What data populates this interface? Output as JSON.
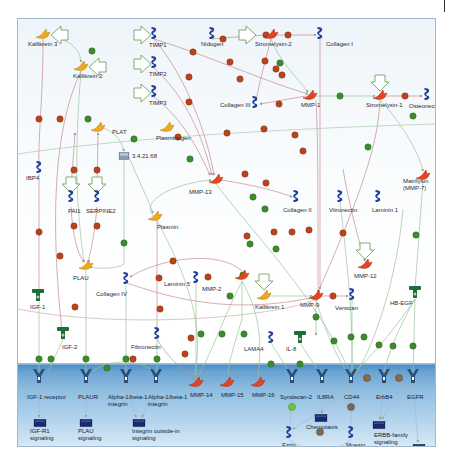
{
  "diagram": {
    "nodes": [
      {
        "id": "kallikrein3",
        "label": "Kallikrein 3",
        "type": "protease-yellow",
        "x": 25,
        "y": 16,
        "lx": 10,
        "ly": 22
      },
      {
        "id": "kallikrein2",
        "label": "Kallikrein 2",
        "type": "protease-yellow",
        "x": 63,
        "y": 48,
        "lx": 55,
        "ly": 54
      },
      {
        "id": "timp1",
        "label": "TIMP1",
        "type": "inhibitor-blue",
        "x": 136,
        "y": 16,
        "lx": 131,
        "ly": 23
      },
      {
        "id": "timp2",
        "label": "TIMP2",
        "type": "inhibitor-blue",
        "x": 136,
        "y": 45,
        "lx": 131,
        "ly": 52
      },
      {
        "id": "timp3",
        "label": "TIMP3",
        "type": "inhibitor-blue",
        "x": 136,
        "y": 74,
        "lx": 131,
        "ly": 81
      },
      {
        "id": "nidogen",
        "label": "Nidogen",
        "type": "inhibitor-blue",
        "x": 194,
        "y": 16,
        "lx": 183,
        "ly": 22
      },
      {
        "id": "stromelysin2",
        "label": "Stromelysin-2",
        "type": "protease-red",
        "x": 253,
        "y": 16,
        "lx": 237,
        "ly": 22
      },
      {
        "id": "collagen1",
        "label": "Collagen I",
        "type": "inhibitor-blue",
        "x": 302,
        "y": 16,
        "lx": 308,
        "ly": 22
      },
      {
        "id": "collagen3",
        "label": "Collagen III",
        "type": "inhibitor-blue",
        "x": 237,
        "y": 85,
        "lx": 202,
        "ly": 83
      },
      {
        "id": "mmp1",
        "label": "MMP-1",
        "type": "protease-red",
        "x": 292,
        "y": 77,
        "lx": 283,
        "ly": 83
      },
      {
        "id": "stromelysin1",
        "label": "Stromelysin-1",
        "type": "protease-red",
        "x": 362,
        "y": 77,
        "lx": 348,
        "ly": 83
      },
      {
        "id": "osteonectin",
        "label": "Osteonectin",
        "type": "inhibitor-blue",
        "x": 409,
        "y": 77,
        "lx": 391,
        "ly": 84
      },
      {
        "id": "plat",
        "label": "PLAT",
        "type": "protease-yellow",
        "x": 80,
        "y": 109,
        "lx": 94,
        "ly": 110
      },
      {
        "id": "plasminogen",
        "label": "Plasminogen",
        "type": "protease-yellow",
        "x": 149,
        "y": 109,
        "lx": 138,
        "ly": 116
      },
      {
        "id": "ec3421",
        "label": "3.4.21.68",
        "type": "compound-grey",
        "x": 106,
        "y": 136,
        "lx": 114,
        "ly": 134
      },
      {
        "id": "ibp4",
        "label": "IBP4",
        "type": "inhibitor-blue",
        "x": 21,
        "y": 150,
        "lx": 8,
        "ly": 156
      },
      {
        "id": "pai1",
        "label": "PAI1",
        "type": "inhibitor-blue",
        "x": 53,
        "y": 179,
        "lx": 50,
        "ly": 189
      },
      {
        "id": "serpine2",
        "label": "SERPINE2",
        "type": "inhibitor-blue",
        "x": 79,
        "y": 179,
        "lx": 68,
        "ly": 189
      },
      {
        "id": "mmp13",
        "label": "MMP-13",
        "type": "protease-red",
        "x": 198,
        "y": 161,
        "lx": 171,
        "ly": 170
      },
      {
        "id": "plasmin",
        "label": "Plasmin",
        "type": "protease-yellow",
        "x": 137,
        "y": 198,
        "lx": 139,
        "ly": 205
      },
      {
        "id": "collagen2",
        "label": "Collagen II",
        "type": "inhibitor-blue",
        "x": 278,
        "y": 179,
        "lx": 265,
        "ly": 188
      },
      {
        "id": "vitronectin",
        "label": "Vitronectin",
        "type": "inhibitor-blue",
        "x": 322,
        "y": 179,
        "lx": 311,
        "ly": 188
      },
      {
        "id": "laminin1",
        "label": "Laminin 1",
        "type": "inhibitor-blue",
        "x": 360,
        "y": 179,
        "lx": 354,
        "ly": 188
      },
      {
        "id": "matrilysin",
        "label": "Matrilysin\n(MMP-7)",
        "type": "protease-red",
        "x": 405,
        "y": 157,
        "lx": 385,
        "ly": 159
      },
      {
        "id": "plau",
        "label": "PLAU",
        "type": "protease-yellow",
        "x": 68,
        "y": 247,
        "lx": 55,
        "ly": 256
      },
      {
        "id": "igf1",
        "label": "IGF-1",
        "type": "ligand-green",
        "x": 20,
        "y": 278,
        "lx": 12,
        "ly": 285
      },
      {
        "id": "collagen4",
        "label": "Collagen IV",
        "type": "inhibitor-blue",
        "x": 108,
        "y": 261,
        "lx": 78,
        "ly": 272
      },
      {
        "id": "laminin5",
        "label": "Laminin 5",
        "type": "inhibitor-blue",
        "x": 178,
        "y": 260,
        "lx": 146,
        "ly": 262
      },
      {
        "id": "mmp2",
        "label": "MMP-2",
        "type": "protease-red",
        "x": 224,
        "y": 257,
        "lx": 184,
        "ly": 267
      },
      {
        "id": "mmp12",
        "label": "MMP-12",
        "type": "protease-red",
        "x": 347,
        "y": 246,
        "lx": 336,
        "ly": 254
      },
      {
        "id": "kallikrein1",
        "label": "Kallikrein 1",
        "type": "protease-yellow",
        "x": 246,
        "y": 277,
        "lx": 237,
        "ly": 285
      },
      {
        "id": "mmp9",
        "label": "MMP-9",
        "type": "protease-red",
        "x": 298,
        "y": 277,
        "lx": 282,
        "ly": 283
      },
      {
        "id": "versican",
        "label": "Versican",
        "type": "inhibitor-blue",
        "x": 334,
        "y": 277,
        "lx": 317,
        "ly": 286
      },
      {
        "id": "hbegf",
        "label": "HB-EGF",
        "type": "ligand-green",
        "x": 397,
        "y": 275,
        "lx": 372,
        "ly": 281
      },
      {
        "id": "igf2",
        "label": "IGF-2",
        "type": "ligand-green",
        "x": 45,
        "y": 316,
        "lx": 44,
        "ly": 325
      },
      {
        "id": "fibronectin",
        "label": "Fibronectin",
        "type": "inhibitor-blue",
        "x": 139,
        "y": 316,
        "lx": 113,
        "ly": 325
      },
      {
        "id": "lama4",
        "label": "LAMA4",
        "type": "inhibitor-blue",
        "x": 253,
        "y": 320,
        "lx": 226,
        "ly": 327
      },
      {
        "id": "il8",
        "label": "IL-8",
        "type": "ligand-green",
        "x": 282,
        "y": 320,
        "lx": 268,
        "ly": 327
      },
      {
        "id": "igf1r",
        "label": "IGF-1 receptor",
        "type": "receptor",
        "x": 21,
        "y": 359,
        "lx": 9,
        "ly": 375
      },
      {
        "id": "plaur",
        "label": "PLAUR",
        "type": "receptor",
        "x": 68,
        "y": 359,
        "lx": 60,
        "ly": 375
      },
      {
        "id": "a1b1a",
        "label": "Alpha-1/beta-1\nintegrin",
        "type": "receptor",
        "x": 108,
        "y": 359,
        "lx": 90,
        "ly": 375
      },
      {
        "id": "a1b1b",
        "label": "Alpha-1/beta-1\nintegrin",
        "type": "receptor",
        "x": 138,
        "y": 359,
        "lx": 130,
        "ly": 375
      },
      {
        "id": "mmp14",
        "label": "MMP-14",
        "type": "protease-red",
        "x": 178,
        "y": 364,
        "lx": 172,
        "ly": 373
      },
      {
        "id": "mmp15",
        "label": "MMP-15",
        "type": "protease-red",
        "x": 209,
        "y": 364,
        "lx": 203,
        "ly": 373
      },
      {
        "id": "mmp16",
        "label": "MMP-16",
        "type": "protease-red",
        "x": 240,
        "y": 364,
        "lx": 234,
        "ly": 373
      },
      {
        "id": "syndecan2",
        "label": "Syndecan-2",
        "type": "receptor",
        "x": 274,
        "y": 359,
        "lx": 262,
        "ly": 375
      },
      {
        "id": "il8ra",
        "label": "IL8RA",
        "type": "receptor",
        "x": 304,
        "y": 359,
        "lx": 299,
        "ly": 375
      },
      {
        "id": "cd44",
        "label": "CD44",
        "type": "receptor",
        "x": 333,
        "y": 359,
        "lx": 326,
        "ly": 375
      },
      {
        "id": "erbb4",
        "label": "ErbB4",
        "type": "receptor",
        "x": 366,
        "y": 359,
        "lx": 358,
        "ly": 375
      },
      {
        "id": "egfr",
        "label": "EGFR",
        "type": "receptor",
        "x": 395,
        "y": 359,
        "lx": 389,
        "ly": 375
      },
      {
        "id": "igfr1sig",
        "label": "IGF-R1\nsignaling",
        "type": "process",
        "x": 22,
        "y": 403,
        "lx": 12,
        "ly": 409
      },
      {
        "id": "plausig",
        "label": "PLAU\nsignaling",
        "type": "process",
        "x": 68,
        "y": 403,
        "lx": 60,
        "ly": 409
      },
      {
        "id": "integrinsig",
        "label": "Integrin outside-in\nsignaling",
        "type": "process",
        "x": 121,
        "y": 403,
        "lx": 114,
        "ly": 409
      },
      {
        "id": "chemotaxis",
        "label": "Chemotaxis",
        "type": "process",
        "x": 303,
        "y": 398,
        "lx": 288,
        "ly": 405
      },
      {
        "id": "ezrin",
        "label": "Ezrin",
        "type": "inhibitor-blue",
        "x": 271,
        "y": 415,
        "lx": 264,
        "ly": 423
      },
      {
        "id": "moesin",
        "label": "Moesin",
        "type": "inhibitor-blue",
        "x": 333,
        "y": 415,
        "lx": 328,
        "ly": 423
      },
      {
        "id": "cytoskeleton",
        "label": "Cytoskeleton remodeling",
        "type": "process",
        "x": 303,
        "y": 430,
        "lx": 279,
        "ly": 436
      },
      {
        "id": "erbbsig",
        "label": "ERBB-family\nsignaling",
        "type": "process",
        "x": 361,
        "y": 405,
        "lx": 356,
        "ly": 413
      },
      {
        "id": "egfsig",
        "label": "EGF\nsignaling pathway",
        "type": "process",
        "x": 401,
        "y": 428,
        "lx": 374,
        "ly": 426
      }
    ],
    "colors": {
      "protease_red": "#e8431c",
      "protease_yellow": "#f0a81a",
      "inhibitor_blue": "#1f3d9a",
      "ligand_green": "#1f6e38",
      "receptor": "#2a4f7a",
      "process": "#1b2a6b",
      "cleavage_badge": "#b5381a",
      "activation_badge": "#3a8f2d",
      "edge_inhibit": "#c87e7e",
      "edge_activate": "#88b488",
      "edge_neutral": "#a7a7a7",
      "arrow_outline": "#5a9a4a",
      "membrane": "#5f9ccd"
    },
    "badge_labels": {
      "cleavage": "C",
      "binding": "B",
      "green": "C"
    }
  }
}
